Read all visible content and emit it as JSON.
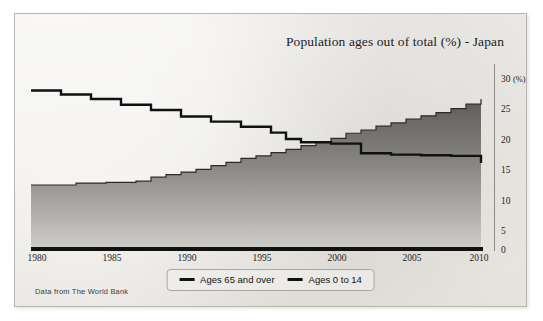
{
  "chart_data": {
    "type": "area",
    "title": "Population ages out of total (%) - Japan",
    "xlabel": "",
    "ylabel": "",
    "yunit": "(%)",
    "xlim": [
      1980,
      2010
    ],
    "ylim": [
      0,
      30
    ],
    "yticks": [
      0,
      5,
      10,
      15,
      20,
      25,
      30
    ],
    "xticks": [
      1980,
      1985,
      1990,
      1995,
      2000,
      2005,
      2010
    ],
    "grid": false,
    "legend_position": "bottom-center",
    "source": "Data from The World Bank",
    "x": [
      1980,
      1981,
      1982,
      1983,
      1984,
      1985,
      1986,
      1987,
      1988,
      1989,
      1990,
      1991,
      1992,
      1993,
      1994,
      1995,
      1996,
      1997,
      1998,
      1999,
      2000,
      2001,
      2002,
      2003,
      2004,
      2005,
      2006,
      2007,
      2008,
      2009,
      2010
    ],
    "series": [
      {
        "name": "Ages 65 and over",
        "color": "#3b3b3b",
        "filled": true,
        "values": [
          9.9,
          9.9,
          9.9,
          10.2,
          10.2,
          10.3,
          10.3,
          10.5,
          11.1,
          11.5,
          11.9,
          12.3,
          12.9,
          13.4,
          14.0,
          14.4,
          14.9,
          15.4,
          16.0,
          16.5,
          17.1,
          17.9,
          18.4,
          19.0,
          19.5,
          20.1,
          20.6,
          21.1,
          21.7,
          22.4,
          23.2
        ]
      },
      {
        "name": "Ages 0 to 14",
        "color": "#111111",
        "filled": false,
        "values": [
          24.5,
          24.5,
          23.9,
          23.9,
          23.2,
          23.2,
          22.3,
          22.3,
          21.5,
          21.5,
          20.5,
          20.5,
          19.7,
          19.7,
          18.9,
          18.9,
          18.0,
          17.0,
          16.5,
          16.5,
          16.3,
          16.3,
          14.8,
          14.8,
          14.6,
          14.6,
          14.5,
          14.5,
          14.4,
          14.4,
          13.3
        ]
      }
    ]
  },
  "legend": {
    "items": [
      {
        "label": "Ages 65 and over"
      },
      {
        "label": "Ages 0 to 14"
      }
    ]
  },
  "axes": {
    "y_top_label": "30",
    "y_unit": "(%)",
    "y_labels": [
      "30",
      "25",
      "20",
      "15",
      "10",
      "5",
      "0"
    ],
    "x_labels": [
      "1980",
      "1985",
      "1990",
      "1995",
      "2000",
      "2005",
      "2010"
    ]
  },
  "footer": {
    "source": "Data from The World Bank"
  }
}
